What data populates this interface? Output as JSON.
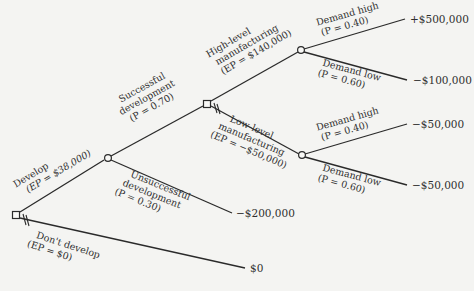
{
  "diagram": {
    "type": "decision-tree",
    "nodes": {
      "develop_decision": {
        "kind": "decision",
        "x": 16,
        "y": 215
      },
      "development_chance": {
        "kind": "chance",
        "x": 108,
        "y": 158
      },
      "manufacturing_decision": {
        "kind": "decision",
        "x": 207,
        "y": 104
      },
      "high_demand_chance": {
        "kind": "chance",
        "x": 301,
        "y": 50
      },
      "low_demand_chance": {
        "kind": "chance",
        "x": 302,
        "y": 155
      }
    },
    "branches": {
      "develop": {
        "line1": "Develop",
        "line2": "(EP = $38,000)"
      },
      "dont_develop": {
        "line1": "Don't develop",
        "line2": "(EP = $0)",
        "payoff": "$0",
        "pruned": true
      },
      "successful": {
        "line1": "Successful",
        "line2": "development",
        "line3": "(P = 0.70)"
      },
      "unsuccessful": {
        "line1": "Unsuccessful",
        "line2": "development",
        "line3": "(P = 0.30)",
        "payoff": "−$200,000"
      },
      "high_level": {
        "line1": "High-level",
        "line2": "manufacturing",
        "line3": "(EP = $140,000)"
      },
      "low_level": {
        "line1": "Low-level",
        "line2": "manufacturing",
        "line3": "(EP = −$50,000)",
        "pruned": true
      },
      "high_demand_high": {
        "line1": "Demand high",
        "line2": "(P = 0.40)",
        "payoff": "+$500,000"
      },
      "high_demand_low": {
        "line1": "Demand low",
        "line2": "(P = 0.60)",
        "payoff": "−$100,000"
      },
      "low_demand_high": {
        "line1": "Demand high",
        "line2": "(P = 0.40)",
        "payoff": "−$50,000"
      },
      "low_demand_low": {
        "line1": "Demand low",
        "line2": "(P = 0.60)",
        "payoff": "−$50,000"
      }
    }
  }
}
